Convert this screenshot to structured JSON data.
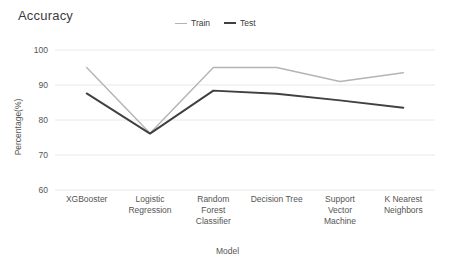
{
  "chart_data": {
    "type": "line",
    "title": "Accuracy",
    "xlabel": "Model",
    "ylabel": "Percentage(%)",
    "categories": [
      "XGBooster",
      "Logistic Regression",
      "Random Forest Classifier",
      "Decision Tree",
      "Support Vector Machine",
      "K Nearest Neighbors"
    ],
    "category_lines": [
      [
        "XGBooster"
      ],
      [
        "Logistic",
        "Regression"
      ],
      [
        "Random",
        "Forest",
        "Classifier"
      ],
      [
        "Decision Tree"
      ],
      [
        "Support",
        "Vector",
        "Machine"
      ],
      [
        "K Nearest",
        "Neighbors"
      ]
    ],
    "series": [
      {
        "name": "Train",
        "color": "#b4b4b4",
        "values": [
          95.0,
          76.2,
          95.0,
          95.0,
          91.0,
          93.5
        ]
      },
      {
        "name": "Test",
        "color": "#404040",
        "values": [
          87.6,
          76.1,
          88.4,
          87.5,
          85.6,
          83.5
        ]
      }
    ],
    "ylim": [
      60,
      100
    ],
    "yticks": [
      60,
      70,
      80,
      90,
      100
    ],
    "ytick_labels": [
      "60",
      "70",
      "80",
      "90",
      "100"
    ],
    "grid": true,
    "grid_color": "#e8e8e8",
    "legend_position": "top-center",
    "background": "#ffffff"
  }
}
